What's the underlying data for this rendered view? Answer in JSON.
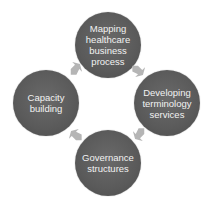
{
  "diagram": {
    "type": "cycle",
    "nodes": [
      {
        "id": "top",
        "label": "Mapping\nhealthcare\nbusiness\nprocess"
      },
      {
        "id": "right",
        "label": "Developing\nterminology\nservices"
      },
      {
        "id": "bottom",
        "label": "Governance\nstructures"
      },
      {
        "id": "left",
        "label": "Capacity\nbuilding"
      }
    ],
    "arrows": [
      {
        "from": "top",
        "to": "right"
      },
      {
        "from": "right",
        "to": "bottom"
      },
      {
        "from": "bottom",
        "to": "left"
      },
      {
        "from": "left",
        "to": "top"
      }
    ],
    "colors": {
      "node_fill": "#5a5a5a",
      "node_text": "#f2f2f2",
      "arrow_fill": "#b5b5b5",
      "background": "#ffffff"
    }
  }
}
